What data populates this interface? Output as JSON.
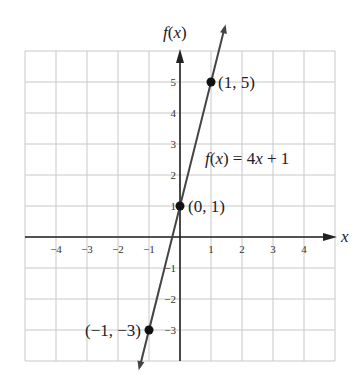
{
  "chart_data": {
    "type": "line",
    "title": "",
    "xlabel": "x",
    "ylabel": "f(x)",
    "xlim": [
      -5,
      5
    ],
    "ylim": [
      -4,
      6
    ],
    "grid": true,
    "x_ticks": [
      -4,
      -3,
      -2,
      -1,
      1,
      2,
      3,
      4
    ],
    "y_ticks": [
      -3,
      -2,
      -1,
      1,
      2,
      3,
      4,
      5
    ],
    "x_tick_labels": [
      "−4",
      "−3",
      "−2",
      "−1",
      "1",
      "2",
      "3",
      "4"
    ],
    "y_tick_labels": [
      "−3",
      "−2",
      "−1",
      "1",
      "2",
      "3",
      "4",
      "5"
    ],
    "series": [
      {
        "name": "f(x) = 4x + 1",
        "equation": {
          "slope": 4,
          "intercept": 1
        },
        "x": [
          -1,
          0,
          1
        ],
        "y": [
          -3,
          1,
          5
        ]
      }
    ],
    "points": [
      {
        "x": 1,
        "y": 5,
        "label": "(1, 5)"
      },
      {
        "x": 0,
        "y": 1,
        "label": "(0, 1)"
      },
      {
        "x": -1,
        "y": -3,
        "label": "(−1, −3)"
      }
    ],
    "annotations": [
      {
        "text": "f(x) = 4x + 1",
        "x": 1.3,
        "y": 2.4
      }
    ]
  },
  "labels": {
    "x_axis": "x",
    "y_axis": "f(x)",
    "equation": "f(x) = 4x + 1"
  },
  "colors": {
    "grid": "#c8c8c8",
    "axis": "#222222",
    "line": "#444444",
    "point": "#111111"
  }
}
